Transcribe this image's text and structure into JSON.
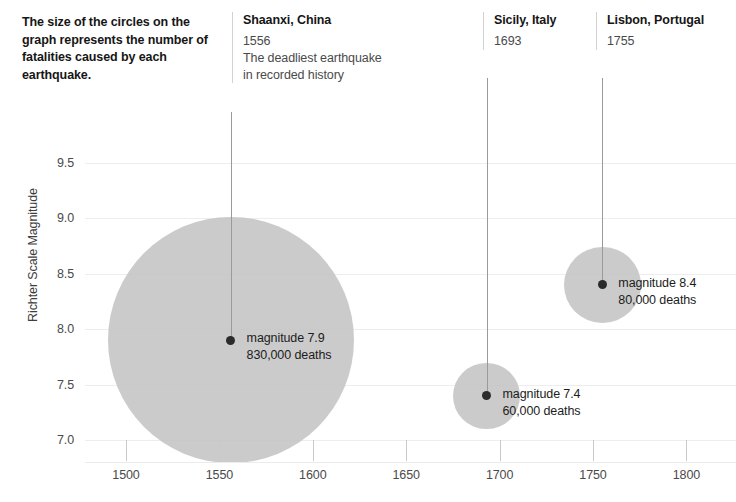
{
  "intro": {
    "text": "The size of the circles on the graph represents the number of fatalities caused by each earthquake."
  },
  "chart_data": {
    "type": "scatter",
    "title": "",
    "xlabel": "",
    "ylabel": "Richter Scale Magnitude",
    "xlim": [
      1488,
      1836
    ],
    "ylim": [
      6.77,
      9.73
    ],
    "xticks": [
      1500,
      1550,
      1600,
      1650,
      1700,
      1750,
      1800
    ],
    "xtick_labels": [
      "1500",
      "1550",
      "1600",
      "1650",
      "1700",
      "1750",
      "1800"
    ],
    "yticks": [
      7.0,
      7.5,
      8.0,
      8.5,
      9.0,
      9.5
    ],
    "ytick_labels": [
      "7.0",
      "7.5",
      "8.0",
      "8.5",
      "9.0",
      "9.5"
    ],
    "grid": true,
    "legend": "none",
    "size_encoding": "deaths",
    "points": [
      {
        "name": "Shaanxi, China",
        "year": 1556,
        "year_label": "1556",
        "description": "The deadliest earthquake\nin recorded history",
        "magnitude": 7.9,
        "deaths": 830000,
        "magnitude_label": "magnitude 7.9",
        "deaths_label": "830,000 deaths",
        "point_label": "magnitude 7.9\n830,000 deaths"
      },
      {
        "name": "Sicily, Italy",
        "year": 1693,
        "year_label": "1693",
        "description": "",
        "magnitude": 7.4,
        "deaths": 60000,
        "magnitude_label": "magnitude 7.4",
        "deaths_label": "60,000 deaths",
        "point_label": "magnitude 7.4\n60,000 deaths"
      },
      {
        "name": "Lisbon, Portugal",
        "year": 1755,
        "year_label": "1755",
        "description": "",
        "magnitude": 8.4,
        "deaths": 80000,
        "magnitude_label": "magnitude 8.4",
        "deaths_label": "80,000 deaths",
        "point_label": "magnitude 8.4\n80,000 deaths"
      }
    ]
  },
  "colors": {
    "bubble": "#c4c4c4",
    "dot": "#2b2b2b",
    "gridline": "#ededed",
    "text": "#161616",
    "muted_text": "#4a4a4a"
  }
}
